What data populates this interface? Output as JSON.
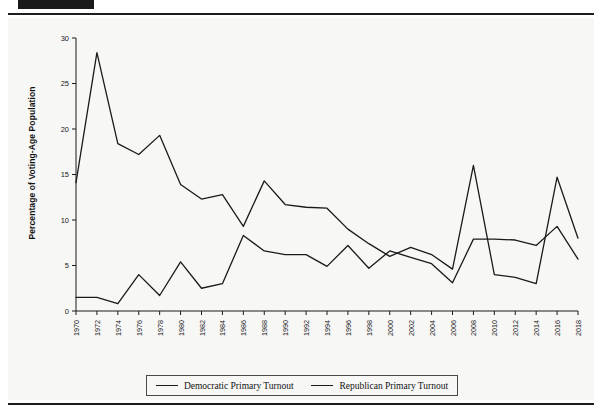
{
  "page": {
    "header_cropped_text": "",
    "background_color": "#f7f7f6",
    "rule_color": "#1d1d1d"
  },
  "legend": {
    "items": [
      {
        "label": "Democratic Primary Turnout",
        "color": "#1a1a1a"
      },
      {
        "label": "Republican Primary Turnout",
        "color": "#1a1a1a"
      }
    ]
  },
  "chart_data": {
    "type": "line",
    "title": "",
    "xlabel": "",
    "ylabel": "Percentage of Voting-Age Population",
    "xlim": [
      1970,
      2018
    ],
    "ylim": [
      0,
      30
    ],
    "yticks": [
      0,
      5,
      10,
      15,
      20,
      25,
      30
    ],
    "grid": false,
    "legend_position": "bottom",
    "categories": [
      "1970",
      "1972",
      "1974",
      "1976",
      "1978",
      "1980",
      "1982",
      "1984",
      "1986",
      "1988",
      "1990",
      "1992",
      "1994",
      "1996",
      "1998",
      "2000",
      "2002",
      "2004",
      "2006",
      "2008",
      "2010",
      "2012",
      "2014",
      "2016",
      "2018"
    ],
    "x": [
      1970,
      1972,
      1974,
      1976,
      1978,
      1980,
      1982,
      1984,
      1986,
      1988,
      1990,
      1992,
      1994,
      1996,
      1998,
      2000,
      2002,
      2004,
      2006,
      2008,
      2010,
      2012,
      2014,
      2016,
      2018
    ],
    "series": [
      {
        "name": "Democratic Primary Turnout",
        "color": "#1a1a1a",
        "values": [
          14.1,
          28.4,
          18.4,
          17.2,
          19.3,
          13.9,
          12.3,
          12.8,
          9.3,
          14.3,
          11.7,
          11.4,
          11.3,
          9.0,
          7.4,
          6.0,
          7.0,
          6.2,
          4.6,
          16.0,
          4.0,
          3.7,
          3.0,
          14.7,
          8.0
        ]
      },
      {
        "name": "Republican Primary Turnout",
        "color": "#1a1a1a",
        "values": [
          1.5,
          1.5,
          0.8,
          4.0,
          1.7,
          5.4,
          2.5,
          3.0,
          8.3,
          6.6,
          6.2,
          6.2,
          4.9,
          7.2,
          4.7,
          6.6,
          5.9,
          5.2,
          3.1,
          7.9,
          7.9,
          7.8,
          7.2,
          9.3,
          5.7
        ]
      }
    ]
  }
}
